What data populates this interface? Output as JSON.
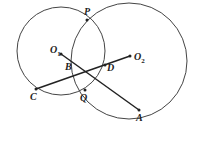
{
  "diagram": {
    "type": "geometry",
    "colors": {
      "stroke": "#333333",
      "background": "#ffffff"
    },
    "circles": [
      {
        "name": "circle-O1",
        "center": [
          61,
          51
        ],
        "r": 44
      },
      {
        "name": "circle-O2",
        "center": [
          129,
          61
        ],
        "r": 58
      }
    ],
    "points": {
      "P": {
        "label": "P",
        "xy": [
          87,
          20
        ]
      },
      "Q": {
        "label": "Q",
        "xy": [
          85,
          90
        ]
      },
      "O1": {
        "label": "O",
        "sub": "1",
        "xy": [
          61,
          54
        ]
      },
      "O2": {
        "label": "O",
        "sub": "2",
        "xy": [
          130,
          56
        ]
      },
      "B": {
        "label": "B",
        "xy": [
          72,
          63
        ]
      },
      "D": {
        "label": "D",
        "xy": [
          105,
          65
        ]
      },
      "C": {
        "label": "C",
        "xy": [
          36,
          89
        ]
      },
      "A": {
        "label": "A",
        "xy": [
          139,
          110
        ]
      }
    },
    "segments": [
      {
        "from": "C",
        "to": "O2"
      },
      {
        "from": "O1",
        "to": "A"
      }
    ]
  }
}
